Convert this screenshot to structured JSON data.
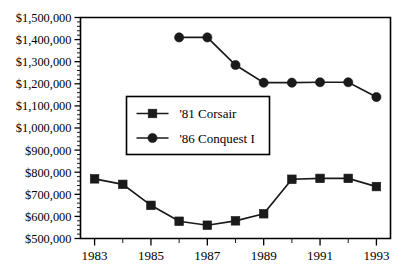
{
  "chart_data": {
    "type": "line",
    "title": "",
    "subtitle": "",
    "xlabel": "",
    "ylabel": "",
    "x": [
      1983,
      1984,
      1985,
      1986,
      1987,
      1988,
      1989,
      1990,
      1991,
      1992,
      1993
    ],
    "xlim": [
      1982.5,
      1993.5
    ],
    "ylim": [
      500000,
      1500000
    ],
    "grid": false,
    "legend_position": "center-left-inside",
    "x_tick_labels": [
      "1983",
      "1985",
      "1987",
      "1989",
      "1991",
      "1993"
    ],
    "x_tick_values": [
      1983,
      1985,
      1987,
      1989,
      1991,
      1993
    ],
    "x_minor_tick_values": [
      1984,
      1986,
      1988,
      1990,
      1992
    ],
    "y_tick_labels": [
      "$500,000",
      "$600,000",
      "$700,000",
      "$800,000",
      "$900,000",
      "$1,000,000",
      "$1,100,000",
      "$1,200,000",
      "$1,300,000",
      "$1,400,000",
      "$1,500,000"
    ],
    "y_tick_values": [
      500000,
      600000,
      700000,
      800000,
      900000,
      1000000,
      1100000,
      1200000,
      1300000,
      1400000,
      1500000
    ],
    "y_minor_tick_step": 20000,
    "series": [
      {
        "name": "'81 Corsair",
        "marker": "square",
        "color": "#1a1a1a",
        "x": [
          1983,
          1984,
          1985,
          1986,
          1987,
          1988,
          1989,
          1990,
          1991,
          1992,
          1993
        ],
        "values": [
          770000,
          745000,
          650000,
          578000,
          560000,
          580000,
          612000,
          768000,
          772000,
          772000,
          735000
        ]
      },
      {
        "name": "'86 Conquest I",
        "marker": "circle",
        "color": "#1a1a1a",
        "x": [
          1986,
          1987,
          1988,
          1989,
          1990,
          1991,
          1992,
          1993
        ],
        "values": [
          1410000,
          1410000,
          1285000,
          1205000,
          1205000,
          1207000,
          1207000,
          1140000
        ]
      }
    ]
  },
  "legend": {
    "entries": [
      {
        "label": "'81 Corsair",
        "marker": "square"
      },
      {
        "label": "'86 Conquest I",
        "marker": "circle"
      }
    ]
  },
  "colors": {
    "ink": "#1a1a1a",
    "axis": "#000000",
    "background": "#ffffff"
  }
}
